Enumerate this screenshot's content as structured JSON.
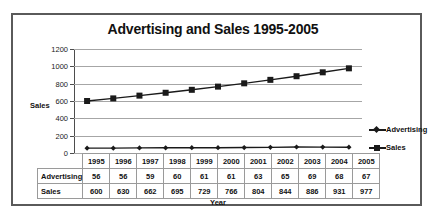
{
  "chart_data": {
    "type": "line",
    "title": "Advertising and Sales 1995-2005",
    "xlabel": "Year",
    "ylabel": "Sales",
    "ylim": [
      0,
      1200
    ],
    "ytick_step": 200,
    "grid": true,
    "legend_position": "right",
    "categories": [
      "1995",
      "1996",
      "1997",
      "1998",
      "1999",
      "2000",
      "2001",
      "2002",
      "2003",
      "2004",
      "2005"
    ],
    "series": [
      {
        "name": "Advertising",
        "marker": "diamond",
        "color": "#1a1a1a",
        "values": [
          56,
          56,
          59,
          60,
          61,
          61,
          63,
          65,
          69,
          68,
          67
        ]
      },
      {
        "name": "Sales",
        "marker": "square",
        "color": "#1a1a1a",
        "values": [
          600,
          630,
          662,
          695,
          729,
          766,
          804,
          844,
          886,
          931,
          977
        ]
      }
    ],
    "ytick_labels": [
      "1200",
      "1000",
      "800",
      "600",
      "400",
      "200",
      "0"
    ]
  },
  "legend": {
    "items": [
      {
        "label": "Advertising",
        "marker": "diamond"
      },
      {
        "label": "Sales",
        "marker": "square"
      }
    ]
  },
  "table": {
    "header_row": [
      "1995",
      "1996",
      "1997",
      "1998",
      "1999",
      "2000",
      "2001",
      "2002",
      "2003",
      "2004",
      "2005"
    ],
    "rows": [
      {
        "label": "Advertising",
        "values": [
          "56",
          "56",
          "59",
          "60",
          "61",
          "61",
          "63",
          "65",
          "69",
          "68",
          "67"
        ]
      },
      {
        "label": "Sales",
        "values": [
          "600",
          "630",
          "662",
          "695",
          "729",
          "766",
          "804",
          "844",
          "886",
          "931",
          "977"
        ]
      }
    ]
  },
  "colors": {
    "frame": "#5a5a5a",
    "gridline": "#a6a6a6",
    "series": "#1a1a1a",
    "table_border": "#9a9a9a"
  }
}
